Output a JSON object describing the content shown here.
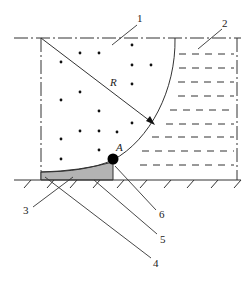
{
  "diagram": {
    "type": "engineering schematic (cross-section)",
    "labels": {
      "part_1": "1",
      "part_2": "2",
      "part_3": "3",
      "part_4": "4",
      "part_5": "5",
      "part_6": "6",
      "point_A": "A",
      "radius": "R"
    },
    "regions": [
      {
        "id": "1",
        "description": "dotted region inside circular arc (quarter-circle of radius R)",
        "fill": "dots"
      },
      {
        "id": "2",
        "description": "dashed-line region to the right of the arc",
        "fill": "horizontal dashes"
      },
      {
        "id": "shaded",
        "description": "gray shaded fillet between arc and ground near point A",
        "color": "#b0b0b0"
      }
    ],
    "point_A": {
      "marker": "filled circle",
      "color": "#000000"
    },
    "ground": {
      "style": "line with hatching"
    },
    "colors": {
      "line": "#222222",
      "shade": "#b3b3b3",
      "background": "#ffffff"
    }
  },
  "caption": ""
}
